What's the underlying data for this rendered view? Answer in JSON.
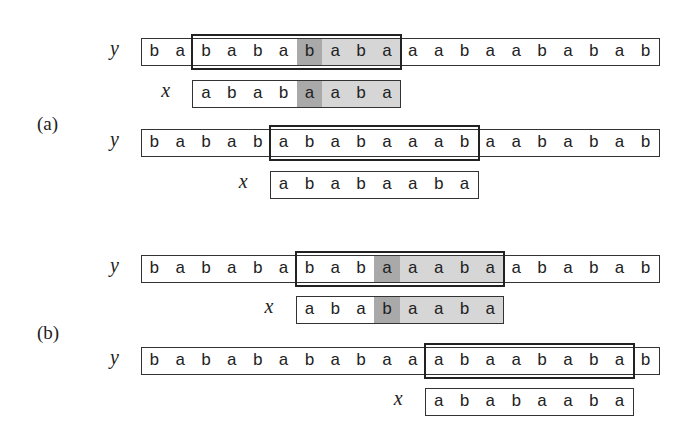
{
  "figure": {
    "panels": [
      {
        "label": "(a)",
        "label_pos": [
          37,
          113
        ],
        "rows": [
          {
            "y_label": "y",
            "x_label": "x",
            "y_string": "babababab aaabaababab",
            "y_chars": [
              "b",
              "a",
              "b",
              "a",
              "b",
              "a",
              "b",
              "a",
              "b",
              "a",
              "a",
              "a",
              "b",
              "a",
              "a",
              "b",
              "a",
              "b",
              "a",
              "b"
            ],
            "x_chars": [
              "a",
              "b",
              "a",
              "b",
              "a",
              "a",
              "b",
              "a"
            ],
            "shift": 2,
            "mismatch_x_index": 4,
            "match_suffix_from": 5,
            "top_y": 38,
            "top_x": 80
          },
          {
            "y_label": "y",
            "x_label": "x",
            "y_chars": [
              "b",
              "a",
              "b",
              "a",
              "b",
              "a",
              "b",
              "a",
              "b",
              "a",
              "a",
              "a",
              "b",
              "a",
              "a",
              "b",
              "a",
              "b",
              "a",
              "b"
            ],
            "x_chars": [
              "a",
              "b",
              "a",
              "b",
              "a",
              "a",
              "b",
              "a"
            ],
            "shift": 5,
            "mismatch_x_index": -1,
            "match_suffix_from": -1,
            "top_y": 129,
            "top_x": 171
          }
        ]
      },
      {
        "label": "(b)",
        "label_pos": [
          37,
          322
        ],
        "rows": [
          {
            "y_label": "y",
            "x_label": "x",
            "y_chars": [
              "b",
              "a",
              "b",
              "a",
              "b",
              "a",
              "b",
              "a",
              "b",
              "a",
              "a",
              "a",
              "b",
              "a",
              "a",
              "b",
              "a",
              "b",
              "a",
              "b"
            ],
            "x_chars": [
              "a",
              "b",
              "a",
              "b",
              "a",
              "a",
              "b",
              "a"
            ],
            "shift": 6,
            "mismatch_x_index": 3,
            "match_suffix_from": 4,
            "top_y": 255,
            "top_x": 296
          },
          {
            "y_label": "y",
            "x_label": "x",
            "y_chars": [
              "b",
              "a",
              "b",
              "a",
              "b",
              "a",
              "b",
              "a",
              "b",
              "a",
              "a",
              "a",
              "b",
              "a",
              "a",
              "b",
              "a",
              "b",
              "a",
              "b"
            ],
            "x_chars": [
              "a",
              "b",
              "a",
              "b",
              "a",
              "a",
              "b",
              "a"
            ],
            "shift": 11,
            "mismatch_x_index": -1,
            "match_suffix_from": -1,
            "top_y": 347,
            "top_x": 388
          }
        ]
      }
    ],
    "colors": {
      "mismatch": "#a9a9a9",
      "matched_suffix": "#d6d6d6",
      "border": "#333333"
    }
  }
}
